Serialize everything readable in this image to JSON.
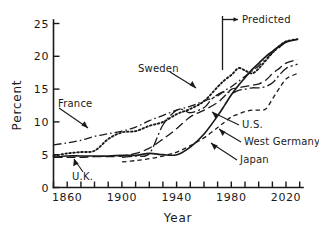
{
  "chart_data": {
    "type": "line",
    "title": "",
    "xlabel": "Year",
    "ylabel": "Percent",
    "xlim": [
      1850,
      2032
    ],
    "ylim": [
      0,
      26
    ],
    "grid": false,
    "legend_position": "inline-annotations",
    "xticks": [
      1860,
      1900,
      1940,
      1980,
      2020
    ],
    "xtick_labels": [
      "1860",
      "1900",
      "1940",
      "1980",
      "2020"
    ],
    "xminor_step": 10,
    "yticks": [
      0,
      5,
      10,
      15,
      20,
      25
    ],
    "ytick_labels": [
      "0",
      "5",
      "10",
      "15",
      "20",
      "25"
    ],
    "annotations": [
      {
        "name": "predicted",
        "text": "Predicted",
        "x": 1980,
        "style": "vertical-line-with-right-arrow"
      }
    ],
    "series": [
      {
        "name": "U.S.",
        "style": "solid",
        "label": "U.S.",
        "x": [
          1850,
          1860,
          1870,
          1880,
          1890,
          1900,
          1910,
          1920,
          1930,
          1940,
          1950,
          1960,
          1970,
          1975,
          1980,
          1985,
          1990,
          1995,
          2000,
          2005,
          2010,
          2015,
          2020,
          2028
        ],
        "y": [
          4.6,
          4.8,
          4.8,
          4.8,
          4.8,
          4.9,
          4.9,
          5.2,
          5.0,
          5.0,
          6.2,
          8.2,
          11.0,
          12.6,
          14.2,
          15.6,
          16.8,
          18.0,
          19.0,
          20.0,
          20.8,
          21.6,
          22.2,
          22.6
        ]
      },
      {
        "name": "U.K.",
        "style": "long-dash",
        "label": "U.K.",
        "x": [
          1850,
          1860,
          1870,
          1880,
          1890,
          1900,
          1910,
          1920,
          1930,
          1940,
          1950,
          1960,
          1970,
          1975,
          1980,
          1985,
          1990,
          1995,
          2000,
          2005,
          2010,
          2015,
          2020,
          2028
        ],
        "y": [
          4.6,
          4.6,
          4.6,
          4.7,
          4.7,
          4.8,
          5.2,
          6.0,
          7.4,
          9.0,
          10.8,
          11.8,
          13.0,
          14.0,
          15.0,
          15.2,
          15.4,
          15.6,
          15.8,
          16.4,
          17.4,
          18.2,
          19.0,
          19.5
        ]
      },
      {
        "name": "Sweden",
        "style": "dotted",
        "label": "Sweden",
        "x": [
          1850,
          1860,
          1870,
          1880,
          1890,
          1900,
          1910,
          1920,
          1930,
          1940,
          1950,
          1960,
          1970,
          1975,
          1980,
          1985,
          1990,
          1995,
          2000,
          2005,
          2010,
          2015,
          2020,
          2028
        ],
        "y": [
          4.8,
          5.2,
          5.4,
          5.6,
          7.4,
          8.4,
          8.6,
          9.4,
          10.0,
          11.2,
          12.0,
          13.2,
          15.4,
          16.4,
          17.2,
          18.2,
          17.8,
          17.4,
          18.2,
          19.4,
          20.6,
          21.6,
          22.3,
          22.6
        ]
      },
      {
        "name": "France",
        "style": "dash-dot",
        "label": "France",
        "x": [
          1850,
          1860,
          1870,
          1880,
          1890,
          1900,
          1910,
          1920,
          1930,
          1940,
          1950,
          1960,
          1970,
          1975,
          1980,
          1985,
          1990,
          1995,
          2000,
          2005,
          2010,
          2015,
          2020,
          2028
        ],
        "y": [
          6.5,
          6.8,
          7.2,
          7.8,
          8.2,
          8.6,
          9.2,
          10.2,
          11.0,
          11.8,
          12.4,
          13.2,
          14.0,
          14.8,
          15.4,
          16.2,
          17.0,
          17.8,
          18.6,
          19.6,
          20.6,
          21.4,
          22.2,
          22.6
        ]
      },
      {
        "name": "West Germany",
        "style": "dash-dot-long",
        "label": "West Germany",
        "x": [
          1900,
          1910,
          1920,
          1930,
          1940,
          1945,
          1950,
          1960,
          1965,
          1970,
          1975,
          1980,
          1985,
          1990,
          1995,
          2000,
          2005,
          2010,
          2015,
          2020,
          2028
        ],
        "y": [
          4.6,
          4.8,
          5.2,
          9.6,
          11.8,
          11.8,
          11.4,
          12.2,
          13.4,
          14.2,
          14.6,
          14.4,
          14.8,
          15.0,
          15.2,
          15.2,
          15.4,
          16.0,
          17.2,
          18.2,
          18.8
        ]
      },
      {
        "name": "Japan",
        "style": "short-dash",
        "label": "Japan",
        "x": [
          1900,
          1910,
          1920,
          1930,
          1940,
          1950,
          1960,
          1970,
          1975,
          1980,
          1985,
          1990,
          1995,
          2000,
          2005,
          2010,
          2015,
          2020,
          2028
        ],
        "y": [
          3.9,
          4.1,
          4.4,
          4.8,
          5.4,
          6.4,
          7.6,
          9.2,
          10.0,
          10.8,
          11.2,
          11.6,
          11.8,
          11.8,
          12.0,
          13.6,
          15.2,
          16.6,
          17.4
        ]
      }
    ]
  },
  "labels": {
    "sweden": "Sweden",
    "france": "France",
    "uk": "U.K.",
    "us": "U.S.",
    "west_germany": "West Germany",
    "japan": "Japan",
    "predicted": "Predicted"
  },
  "axis": {
    "ylabel": "Percent",
    "xlabel": "Year",
    "y0": "0",
    "y5": "5",
    "y10": "10",
    "y15": "15",
    "y20": "20",
    "y25": "25",
    "x1860": "1860",
    "x1900": "1900",
    "x1940": "1940",
    "x1980": "1980",
    "x2020": "2020"
  },
  "colors": {
    "ink": "#1a1a1a",
    "background": "#ffffff"
  }
}
